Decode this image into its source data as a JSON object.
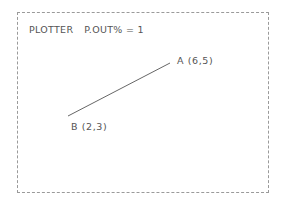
{
  "plot": {
    "title_prefix": "PLOTTER",
    "title_setting": "P.OUT% = 1",
    "line_color": "#555555",
    "frame_color": "#9a9a9a",
    "points": [
      {
        "name": "A",
        "label": "A (6,5)",
        "x": 6,
        "y": 5
      },
      {
        "name": "B",
        "label": "B (2,3)",
        "x": 2,
        "y": 3
      }
    ],
    "segment": {
      "from": "B",
      "to": "A"
    }
  }
}
